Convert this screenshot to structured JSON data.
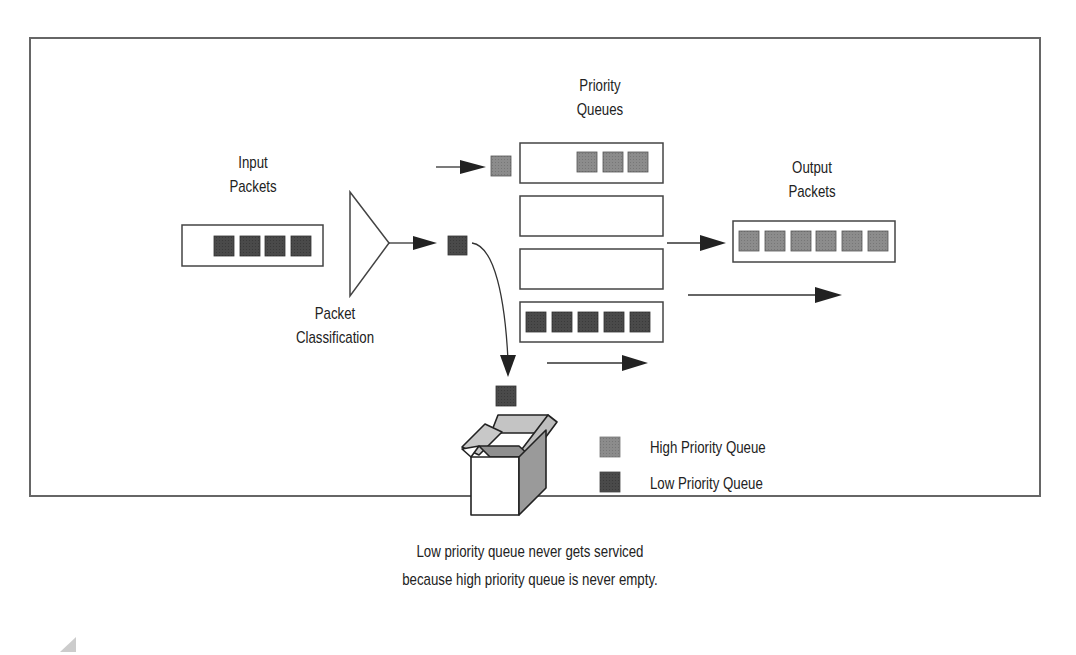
{
  "figure": {
    "labels": {
      "input_packets": [
        "Input",
        "Packets"
      ],
      "packet_classification": [
        "Packet",
        "Classification"
      ],
      "priority_queues": [
        "Priority",
        "Queues"
      ],
      "output_packets": [
        "Output",
        "Packets"
      ]
    },
    "legend": [
      {
        "label": "High Priority Queue",
        "color": "#8a8a8a"
      },
      {
        "label": "Low Priority Queue",
        "color": "#4a4a4a"
      }
    ],
    "caption": [
      "Low priority queue never gets serviced",
      "because high priority queue is never empty."
    ],
    "queues": {
      "input_packet_count": 4,
      "high_priority_packet_count": 3,
      "middle_queue_1_count": 0,
      "middle_queue_2_count": 0,
      "low_priority_packet_count": 5,
      "output_packet_count": 6
    },
    "colors": {
      "high_priority": "#8a8a8a",
      "low_priority": "#4a4a4a",
      "frame": "#666666",
      "stroke": "#333333"
    }
  }
}
